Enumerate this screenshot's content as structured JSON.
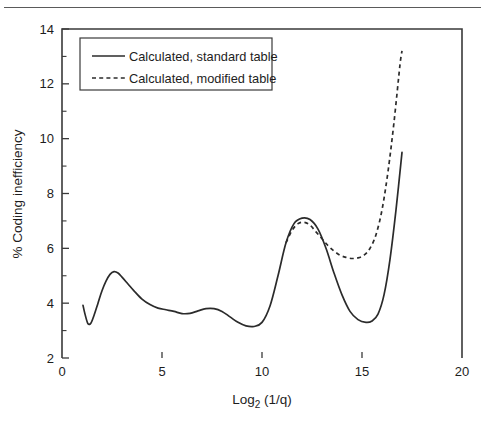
{
  "chart_data": {
    "type": "line",
    "title": "",
    "xlabel": "Log2 (1/q)",
    "xlabel_base": "Log",
    "xlabel_sub": "2",
    "xlabel_rest": " (1/q)",
    "ylabel": "% Coding inefficiency",
    "xlim": [
      0,
      20
    ],
    "ylim": [
      2,
      14
    ],
    "xticks": [
      0,
      5,
      10,
      15,
      20
    ],
    "xtick_labels": [
      "0",
      "5",
      "10",
      "15",
      "20"
    ],
    "yticks": [
      2,
      4,
      6,
      8,
      10,
      12,
      14
    ],
    "ytick_labels": [
      "2",
      "4",
      "6",
      "8",
      "10",
      "12",
      "14"
    ],
    "yticks_minor": [
      3,
      5,
      7,
      9,
      11,
      13
    ],
    "grid": false,
    "legend_position": "upper-left",
    "series": [
      {
        "name": "Calculated, standard table",
        "style": "solid",
        "color": "#2b2b2b",
        "x": [
          1.05,
          1.15,
          1.3,
          1.45,
          1.6,
          1.8,
          2.0,
          2.2,
          2.4,
          2.6,
          2.8,
          3.0,
          3.3,
          3.6,
          4.0,
          4.4,
          4.8,
          5.2,
          5.6,
          6.0,
          6.4,
          6.8,
          7.2,
          7.6,
          8.0,
          8.4,
          8.8,
          9.2,
          9.6,
          10.0,
          10.4,
          10.8,
          11.2,
          11.6,
          12.0,
          12.4,
          12.8,
          13.2,
          13.6,
          14.0,
          14.4,
          14.8,
          15.2,
          15.5,
          15.8,
          16.1,
          16.4,
          16.7,
          17.0
        ],
        "y": [
          3.92,
          3.6,
          3.25,
          3.28,
          3.55,
          4.0,
          4.45,
          4.8,
          5.05,
          5.15,
          5.1,
          4.95,
          4.7,
          4.45,
          4.15,
          3.95,
          3.82,
          3.76,
          3.7,
          3.62,
          3.63,
          3.72,
          3.8,
          3.8,
          3.7,
          3.5,
          3.3,
          3.17,
          3.15,
          3.3,
          3.9,
          5.0,
          6.2,
          6.9,
          7.1,
          7.05,
          6.7,
          6.0,
          5.1,
          4.3,
          3.7,
          3.4,
          3.3,
          3.35,
          3.6,
          4.3,
          5.6,
          7.4,
          9.5
        ]
      },
      {
        "name": "Calculated, modified table",
        "style": "dashed",
        "color": "#2b2b2b",
        "x": [
          11.2,
          11.5,
          11.8,
          12.1,
          12.4,
          12.7,
          13.0,
          13.3,
          13.6,
          13.9,
          14.2,
          14.5,
          14.8,
          15.1,
          15.4,
          15.7,
          16.0,
          16.3,
          16.6,
          16.9,
          17.0
        ],
        "y": [
          6.2,
          6.65,
          6.9,
          6.95,
          6.85,
          6.6,
          6.35,
          6.1,
          5.9,
          5.75,
          5.67,
          5.63,
          5.65,
          5.75,
          6.0,
          6.5,
          7.4,
          8.8,
          10.6,
          12.7,
          13.2
        ]
      }
    ]
  },
  "legend": {
    "entries": [
      {
        "label": "Calculated, standard table",
        "style": "solid"
      },
      {
        "label": "Calculated, modified table",
        "style": "dashed"
      }
    ]
  }
}
